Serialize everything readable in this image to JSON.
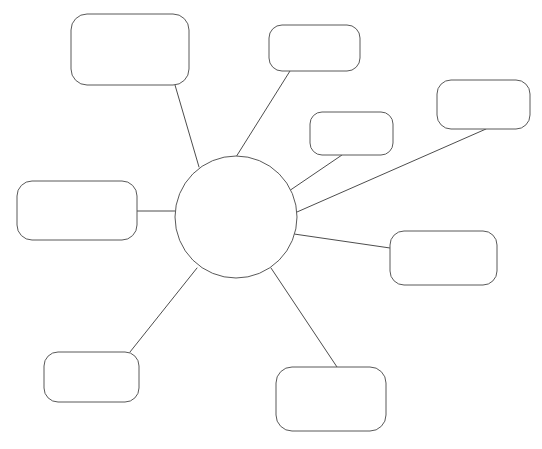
{
  "canvas": {
    "width": 542,
    "height": 449,
    "background_color": "#ffffff",
    "title": ""
  },
  "style": {
    "line_color": "#4d4d4d",
    "shape_stroke_color": "#595959",
    "shape_fill_color": "#ffffff",
    "stroke_width": 1
  },
  "center_node": {
    "name": "central-concept",
    "shape": "circle",
    "label": "",
    "cx": 236,
    "cy": 217,
    "r": 61
  },
  "nodes": [
    {
      "id": "node-top-left",
      "label": "",
      "shape": "rounded-rectangle",
      "x": 71,
      "y": 14,
      "width": 118,
      "height": 71,
      "radius": 16
    },
    {
      "id": "node-top-center",
      "label": "",
      "shape": "rounded-rectangle",
      "x": 269,
      "y": 25,
      "width": 91,
      "height": 46,
      "radius": 13
    },
    {
      "id": "node-upper-right-inner",
      "label": "",
      "shape": "rounded-rectangle",
      "x": 310,
      "y": 112,
      "width": 83,
      "height": 43,
      "radius": 12
    },
    {
      "id": "node-upper-right-outer",
      "label": "",
      "shape": "rounded-rectangle",
      "x": 437,
      "y": 80,
      "width": 93,
      "height": 49,
      "radius": 14
    },
    {
      "id": "node-left-middle",
      "label": "",
      "shape": "rounded-rectangle",
      "x": 17,
      "y": 181,
      "width": 120,
      "height": 59,
      "radius": 15
    },
    {
      "id": "node-right-middle",
      "label": "",
      "shape": "rounded-rectangle",
      "x": 390,
      "y": 231,
      "width": 107,
      "height": 54,
      "radius": 14
    },
    {
      "id": "node-bottom-left",
      "label": "",
      "shape": "rounded-rectangle",
      "x": 44,
      "y": 352,
      "width": 95,
      "height": 50,
      "radius": 14
    },
    {
      "id": "node-bottom-center",
      "label": "",
      "shape": "rounded-rectangle",
      "x": 276,
      "y": 367,
      "width": 110,
      "height": 64,
      "radius": 16
    }
  ],
  "connectors": [
    {
      "id": "connector-top-left",
      "from": "central-concept",
      "to": "node-top-left",
      "x1": 199,
      "y1": 167,
      "x2": 175,
      "y2": 85
    },
    {
      "id": "connector-top-center",
      "from": "central-concept",
      "to": "node-top-center",
      "x1": 236,
      "y1": 157,
      "x2": 290,
      "y2": 71
    },
    {
      "id": "connector-upper-right-inner",
      "from": "central-concept",
      "to": "node-upper-right-inner",
      "x1": 289,
      "y1": 191,
      "x2": 342,
      "y2": 155
    },
    {
      "id": "connector-upper-right-outer",
      "from": "central-concept",
      "to": "node-upper-right-outer",
      "x1": 297,
      "y1": 212,
      "x2": 486,
      "y2": 129
    },
    {
      "id": "connector-left-middle",
      "from": "central-concept",
      "to": "node-left-middle",
      "x1": 175,
      "y1": 211,
      "x2": 137,
      "y2": 211
    },
    {
      "id": "connector-right-middle",
      "from": "central-concept",
      "to": "node-right-middle",
      "x1": 294,
      "y1": 234,
      "x2": 390,
      "y2": 248
    },
    {
      "id": "connector-bottom-left",
      "from": "central-concept",
      "to": "node-bottom-left",
      "x1": 197,
      "y1": 268,
      "x2": 130,
      "y2": 352
    },
    {
      "id": "connector-bottom-center",
      "from": "central-concept",
      "to": "node-bottom-center",
      "x1": 271,
      "y1": 268,
      "x2": 337,
      "y2": 367
    }
  ]
}
